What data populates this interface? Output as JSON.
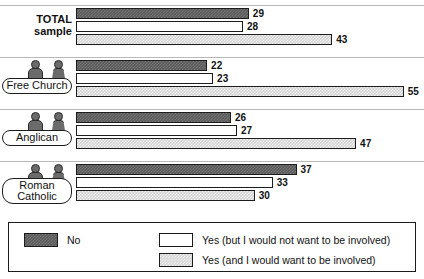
{
  "chart_data": {
    "type": "bar",
    "orientation": "horizontal",
    "title": "",
    "xlabel": "",
    "ylabel": "",
    "xlim": [
      0,
      58
    ],
    "grid": false,
    "legend_position": "bottom",
    "categories": [
      "TOTAL sample",
      "Free Church",
      "Anglican",
      "Roman Catholic"
    ],
    "series": [
      {
        "name": "No",
        "color": "#5c5c5c",
        "values": [
          29,
          22,
          26,
          37
        ]
      },
      {
        "name": "Yes (but I would not want to be involved)",
        "color": "#ffffff",
        "values": [
          28,
          23,
          27,
          33
        ]
      },
      {
        "name": "Yes (and I would want to be involved)",
        "color": "#d6d6d6",
        "values": [
          43,
          55,
          47,
          30
        ]
      }
    ],
    "groups": [
      {
        "label": "TOTAL\nsample",
        "label_style": "plain",
        "has_pictogram": false,
        "bars": [
          {
            "series": "No",
            "value": 29,
            "value_label": "29"
          },
          {
            "series": "Yes (but I would not want to be involved)",
            "value": 28,
            "value_label": "28"
          },
          {
            "series": "Yes (and I would want to be involved)",
            "value": 43,
            "value_label": "43"
          }
        ]
      },
      {
        "label": "Free Church",
        "label_style": "pill",
        "has_pictogram": true,
        "bars": [
          {
            "series": "No",
            "value": 22,
            "value_label": "22"
          },
          {
            "series": "Yes (but I would not want to be involved)",
            "value": 23,
            "value_label": "23"
          },
          {
            "series": "Yes (and I would want to be involved)",
            "value": 55,
            "value_label": "55"
          }
        ]
      },
      {
        "label": "Anglican",
        "label_style": "pill",
        "has_pictogram": true,
        "bars": [
          {
            "series": "No",
            "value": 26,
            "value_label": "26"
          },
          {
            "series": "Yes (but I would not want to be involved)",
            "value": 27,
            "value_label": "27"
          },
          {
            "series": "Yes (and I would want to be involved)",
            "value": 47,
            "value_label": "47"
          }
        ]
      },
      {
        "label": "Roman\nCatholic",
        "label_style": "pill",
        "has_pictogram": true,
        "bars": [
          {
            "series": "No",
            "value": 37,
            "value_label": "37"
          },
          {
            "series": "Yes (but I would not want to be involved)",
            "value": 33,
            "value_label": "33"
          },
          {
            "series": "Yes (and I would want to be involved)",
            "value": 30,
            "value_label": "30"
          }
        ]
      }
    ]
  },
  "legend": {
    "items": [
      {
        "swatch": "s0",
        "label": "No"
      },
      {
        "swatch": "s1",
        "label": "Yes (but I would not want to be involved)"
      },
      {
        "swatch": "s2",
        "label": "Yes (and I would want to be involved)"
      }
    ]
  },
  "layout": {
    "bar_origin_x": 76,
    "px_per_unit": 5.96,
    "bar_height": 11,
    "bar_gap": 2,
    "group_tops": [
      8,
      60,
      112,
      164
    ],
    "separator_ys": [
      5,
      57,
      109,
      161
    ],
    "legend_box": {
      "x": 8,
      "y": 222,
      "w": 408,
      "h": 50
    }
  }
}
